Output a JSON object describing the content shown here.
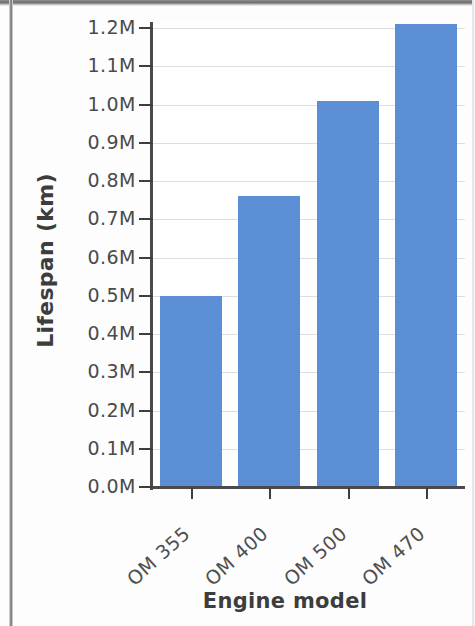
{
  "chart_data": {
    "type": "bar",
    "title": "",
    "xlabel": "Engine model",
    "ylabel": "Lifespan (km)",
    "categories": [
      "OM 355",
      "OM 400",
      "OM 500",
      "OM 470"
    ],
    "values": [
      0.5,
      0.76,
      1.01,
      1.21
    ],
    "value_unit": "millions of km",
    "ylim": [
      0.0,
      1.2
    ],
    "y_tick_labels": [
      "1.2M",
      "1.1M",
      "1.0M",
      "0.9M",
      "0.8M",
      "0.7M",
      "0.6M",
      "0.5M",
      "0.4M",
      "0.3M",
      "0.2M",
      "0.1M",
      "0.0M"
    ],
    "y_tick_values": [
      1.2,
      1.1,
      1.0,
      0.9,
      0.8,
      0.7,
      0.6,
      0.5,
      0.4,
      0.3,
      0.2,
      0.1,
      0.0
    ],
    "grid": true,
    "legend": "none",
    "bar_color": "#5b8ed4",
    "grid_color": "#d9dfe4",
    "axis_color": "#4a4a4a",
    "text_color": "#4b4b4b",
    "x_tick_label_rotation": -42
  }
}
